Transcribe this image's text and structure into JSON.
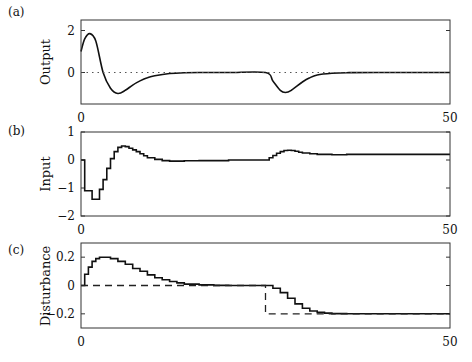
{
  "chart_data": [
    {
      "type": "line",
      "panel_label": "(a)",
      "ylabel": "Output",
      "xlabel": "",
      "xlim": [
        0,
        50
      ],
      "ylim": [
        -1.5,
        2.5
      ],
      "xticks": [
        0,
        50
      ],
      "xtick_labels": [
        "0",
        "50"
      ],
      "yticks": [
        2,
        0
      ],
      "ytick_labels": [
        "2",
        "0"
      ],
      "grid": false,
      "series": [
        {
          "name": "output",
          "style": "solid",
          "x": [
            0,
            0.5,
            1.2,
            2,
            3,
            4,
            5,
            6,
            7,
            8,
            9,
            10,
            12,
            14,
            16,
            20,
            25,
            26,
            27,
            27.7,
            28.5,
            30,
            31,
            32,
            34,
            36,
            40,
            50
          ],
          "y": [
            1.0,
            1.6,
            1.85,
            1.5,
            0.0,
            -0.75,
            -1.0,
            -0.85,
            -0.6,
            -0.4,
            -0.25,
            -0.15,
            -0.05,
            -0.01,
            0,
            0,
            0,
            -0.4,
            -0.85,
            -0.95,
            -0.85,
            -0.45,
            -0.25,
            -0.12,
            -0.04,
            -0.01,
            0,
            0
          ]
        },
        {
          "name": "reference",
          "style": "dotted",
          "x": [
            0,
            50
          ],
          "y": [
            0,
            0
          ]
        }
      ]
    },
    {
      "type": "line",
      "panel_label": "(b)",
      "ylabel": "Input",
      "xlabel": "",
      "xlim": [
        0,
        50
      ],
      "ylim": [
        -2,
        1
      ],
      "xticks": [
        0,
        50
      ],
      "xtick_labels": [
        "0",
        "50"
      ],
      "yticks": [
        1,
        0,
        -1,
        -2
      ],
      "ytick_labels": [
        "1",
        "0",
        "−1",
        "−2"
      ],
      "grid": false,
      "series": [
        {
          "name": "input",
          "style": "step",
          "x": [
            0,
            0.5,
            1,
            1.5,
            2,
            2.5,
            3,
            3.5,
            4,
            4.5,
            5,
            5.5,
            6,
            6.5,
            7,
            7.5,
            8,
            8.5,
            9,
            10,
            11,
            12,
            14,
            16,
            20,
            25,
            25.5,
            26,
            26.5,
            27,
            27.5,
            28,
            28.5,
            29,
            29.5,
            30,
            31,
            32,
            34,
            36,
            40,
            50
          ],
          "y": [
            0,
            -1.1,
            -1.1,
            -1.4,
            -1.4,
            -1.05,
            -0.7,
            -0.3,
            0.05,
            0.3,
            0.45,
            0.5,
            0.48,
            0.42,
            0.36,
            0.3,
            0.22,
            0.15,
            0.08,
            0.02,
            -0.02,
            -0.04,
            -0.03,
            -0.02,
            0,
            0,
            0.08,
            0.16,
            0.24,
            0.3,
            0.34,
            0.35,
            0.34,
            0.31,
            0.28,
            0.25,
            0.22,
            0.2,
            0.19,
            0.2,
            0.2,
            0.2
          ]
        }
      ]
    },
    {
      "type": "line",
      "panel_label": "(c)",
      "ylabel": "Disturbance",
      "xlabel": "",
      "xlim": [
        0,
        50
      ],
      "ylim": [
        -0.3,
        0.3
      ],
      "xticks": [
        0,
        50
      ],
      "xtick_labels": [
        "0",
        "50"
      ],
      "yticks": [
        0.2,
        0,
        -0.2
      ],
      "ytick_labels": [
        "0.2",
        "0",
        "−0.2"
      ],
      "grid": false,
      "series": [
        {
          "name": "estimated disturbance",
          "style": "step",
          "x": [
            0,
            0.5,
            1,
            1.5,
            2,
            2.5,
            3,
            4,
            5,
            6,
            7,
            8,
            9,
            10,
            11,
            12,
            13,
            14,
            16,
            18,
            20,
            25,
            26,
            27,
            28,
            29,
            30,
            31,
            32,
            33,
            34,
            36,
            38,
            40,
            50
          ],
          "y": [
            0,
            0.08,
            0.13,
            0.17,
            0.19,
            0.2,
            0.2,
            0.19,
            0.17,
            0.15,
            0.12,
            0.1,
            0.075,
            0.055,
            0.04,
            0.028,
            0.018,
            0.01,
            0.004,
            0.001,
            0,
            0,
            -0.02,
            -0.05,
            -0.09,
            -0.13,
            -0.16,
            -0.18,
            -0.19,
            -0.195,
            -0.198,
            -0.2,
            -0.2,
            -0.2,
            -0.2
          ]
        },
        {
          "name": "true disturbance",
          "style": "dashed",
          "x": [
            0,
            25,
            25,
            50
          ],
          "y": [
            0,
            0,
            -0.2,
            -0.2
          ]
        }
      ]
    }
  ],
  "layout": {
    "panels": [
      {
        "left": 81,
        "top": 20,
        "right": 450,
        "bottom": 104
      },
      {
        "left": 81,
        "top": 132,
        "right": 450,
        "bottom": 216
      },
      {
        "left": 81,
        "top": 243,
        "right": 450,
        "bottom": 328
      }
    ]
  }
}
